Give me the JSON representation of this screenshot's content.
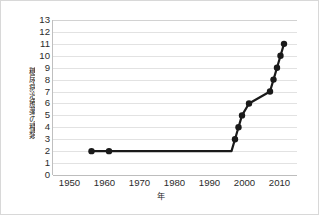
{
  "chart_data": {
    "type": "line",
    "title": "",
    "xlabel": "年",
    "ylabel": "糖尿病治療薬の種類",
    "xlim": [
      1945,
      2015
    ],
    "ylim": [
      0,
      13
    ],
    "grid": true,
    "legend": false,
    "marker": "filled-circle",
    "line_color": "#1a1a1a",
    "marker_color": "#1a1a1a",
    "grid_color": "#e2e2e2",
    "axis_color": "#bfbfbf",
    "x_ticks": [
      1950,
      1960,
      1970,
      1980,
      1990,
      2000,
      2010
    ],
    "x_tick_labels": [
      "1950",
      "1960",
      "1970",
      "1980",
      "1990",
      "2000",
      "2010"
    ],
    "y_ticks": [
      0,
      1,
      2,
      3,
      4,
      5,
      6,
      7,
      8,
      9,
      10,
      11,
      12,
      13
    ],
    "y_tick_labels": [
      "0",
      "1",
      "2",
      "3",
      "4",
      "5",
      "6",
      "7",
      "8",
      "9",
      "10",
      "11",
      "12",
      "13"
    ],
    "x": [
      1956,
      1961,
      1996,
      1997,
      1998,
      1999,
      2001,
      2007,
      2008,
      2009,
      2010,
      2011
    ],
    "values": [
      2,
      2,
      2,
      3,
      4,
      5,
      6,
      7,
      8,
      9,
      10,
      11
    ],
    "points": [
      {
        "x": 1956,
        "y": 2,
        "marker": true
      },
      {
        "x": 1961,
        "y": 2,
        "marker": true
      },
      {
        "x": 1996,
        "y": 2,
        "marker": false
      },
      {
        "x": 1997,
        "y": 3,
        "marker": true
      },
      {
        "x": 1998,
        "y": 4,
        "marker": true
      },
      {
        "x": 1999,
        "y": 5,
        "marker": true
      },
      {
        "x": 2001,
        "y": 6,
        "marker": true
      },
      {
        "x": 2007,
        "y": 7,
        "marker": true
      },
      {
        "x": 2008,
        "y": 8,
        "marker": true
      },
      {
        "x": 2009,
        "y": 9,
        "marker": true
      },
      {
        "x": 2010,
        "y": 10,
        "marker": true
      },
      {
        "x": 2011,
        "y": 11,
        "marker": true
      }
    ]
  }
}
